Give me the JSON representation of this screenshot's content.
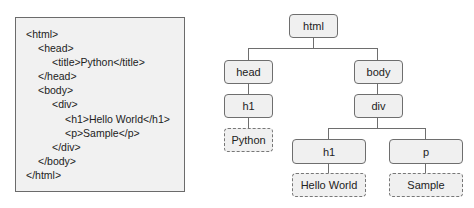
{
  "code": {
    "lines": [
      {
        "indent": 0,
        "text": "<html>"
      },
      {
        "indent": 1,
        "text": "<head>"
      },
      {
        "indent": 2,
        "text": "<title>Python</title>"
      },
      {
        "indent": 1,
        "text": "</head>"
      },
      {
        "indent": 1,
        "text": "<body>"
      },
      {
        "indent": 2,
        "text": "<div>"
      },
      {
        "indent": 3,
        "text": "<h1>Hello World</h1>"
      },
      {
        "indent": 3,
        "text": "<p>Sample</p>"
      },
      {
        "indent": 2,
        "text": "</div>"
      },
      {
        "indent": 1,
        "text": "</body>"
      },
      {
        "indent": 0,
        "text": "</html>"
      }
    ]
  },
  "tree": {
    "root": "html",
    "head": "head",
    "head_child": "h1",
    "head_text": "Python",
    "body": "body",
    "div": "div",
    "div_h1": "h1",
    "div_p": "p",
    "h1_text": "Hello World",
    "p_text": "Sample"
  },
  "colors": {
    "node_fill": "#f0f0f0",
    "node_border": "#6e6e6e",
    "code_bg": "#f1f1f1"
  }
}
